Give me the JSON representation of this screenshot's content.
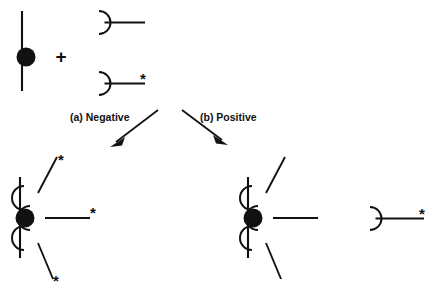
{
  "figure": {
    "background_color": "#ffffff",
    "ink_color": "#111111",
    "width": 441,
    "height": 301
  },
  "symbols": {
    "plus": "+",
    "asterisk": "*"
  },
  "captions": {
    "branch_a": "(a) Negative",
    "branch_b": "(b) Positive"
  },
  "reactants": {
    "cell": {
      "name": "cell-with-receptor",
      "membrane_label": "",
      "receptor_label": ""
    },
    "ligand_unlabeled": {
      "name": "unlabeled-antibody",
      "marker": ""
    },
    "ligand_labeled": {
      "name": "labeled-antibody",
      "marker": "*"
    }
  },
  "products": {
    "negative": {
      "name": "cell-bound-labeled-antibodies",
      "bound_markers": [
        "*",
        "*",
        "*"
      ],
      "free_ligand_present": false
    },
    "positive": {
      "name": "cell-bound-unlabeled-antibodies",
      "bound_markers": [
        "",
        "",
        ""
      ],
      "free_ligand_present": true,
      "free_ligand_marker": "*"
    }
  }
}
